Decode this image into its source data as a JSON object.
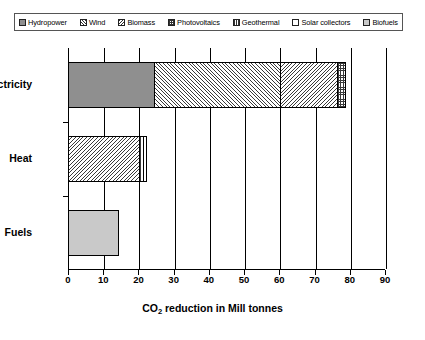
{
  "legend": {
    "items": [
      {
        "label": "Hydropower",
        "key": "hydropower",
        "pattern": "solid-gray"
      },
      {
        "label": "Wind",
        "key": "wind",
        "pattern": "diagonal-up-hatch"
      },
      {
        "label": "Biomass",
        "key": "biomass",
        "pattern": "diagonal-down-hatch"
      },
      {
        "label": "Photovoltaics",
        "key": "photovoltaics",
        "pattern": "cross-hatch"
      },
      {
        "label": "Geothermal",
        "key": "geothermal",
        "pattern": "vertical-hatch"
      },
      {
        "label": "Solar collectors",
        "key": "solarcollectors",
        "pattern": "empty"
      },
      {
        "label": "Biofuels",
        "key": "biofuels",
        "pattern": "solid-light-gray"
      }
    ]
  },
  "axis": {
    "x_title_prefix": "CO",
    "x_title_sub": "2",
    "x_title_suffix": " reduction in Mill tonnes",
    "x_ticks": [
      "0",
      "10",
      "20",
      "30",
      "40",
      "50",
      "60",
      "70",
      "80",
      "90"
    ],
    "categories": [
      "Electricity",
      "Heat",
      "Fuels"
    ]
  },
  "chart_data": {
    "type": "bar",
    "orientation": "horizontal",
    "stacked": true,
    "title": "",
    "xlabel": "CO2 reduction in Mill tonnes",
    "ylabel": "",
    "xlim": [
      0,
      90
    ],
    "categories": [
      "Electricity",
      "Heat",
      "Fuels"
    ],
    "grid": true,
    "legend_position": "top",
    "series": [
      {
        "name": "Hydropower",
        "values": [
          24,
          0,
          0
        ]
      },
      {
        "name": "Wind",
        "values": [
          36,
          0,
          0
        ]
      },
      {
        "name": "Biomass",
        "values": [
          16,
          20,
          0
        ]
      },
      {
        "name": "Photovoltaics",
        "values": [
          2.5,
          0,
          0
        ]
      },
      {
        "name": "Geothermal",
        "values": [
          0,
          1,
          0
        ]
      },
      {
        "name": "Solar collectors",
        "values": [
          0,
          1,
          0
        ]
      },
      {
        "name": "Biofuels",
        "values": [
          0,
          0,
          14
        ]
      }
    ],
    "totals": [
      78.5,
      22,
      14
    ]
  }
}
